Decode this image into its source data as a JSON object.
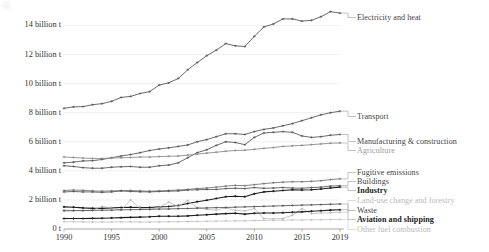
{
  "chart_data": {
    "type": "line",
    "title": "",
    "xlabel": "",
    "ylabel": "",
    "xlim": [
      1990,
      2019
    ],
    "ylim": [
      0,
      15.2
    ],
    "grid": true,
    "legend_position": "right-inline-labels",
    "y_tick_labels": [
      "0 t",
      "2 billion t",
      "4 billion t",
      "6 billion t",
      "8 billion t",
      "10 billion t",
      "12 billion t",
      "14 billion t"
    ],
    "y_tick_values": [
      0,
      2,
      4,
      6,
      8,
      10,
      12,
      14
    ],
    "x_tick_labels": [
      "1990",
      "1995",
      "2000",
      "2005",
      "2010",
      "2015",
      "2019"
    ],
    "x_tick_values": [
      1990,
      1995,
      2000,
      2005,
      2010,
      2015,
      2019
    ],
    "x": [
      1990,
      1991,
      1992,
      1993,
      1994,
      1995,
      1996,
      1997,
      1998,
      1999,
      2000,
      2001,
      2002,
      2003,
      2004,
      2005,
      2006,
      2007,
      2008,
      2009,
      2010,
      2011,
      2012,
      2013,
      2014,
      2015,
      2016,
      2017,
      2018,
      2019
    ],
    "series": [
      {
        "name": "Electricity and heat",
        "label": "Electricity and heat",
        "color": "#5a5a5a",
        "emphasis": "normal",
        "values": [
          8.3,
          8.4,
          8.42,
          8.55,
          8.62,
          8.78,
          9.05,
          9.12,
          9.32,
          9.45,
          9.9,
          10.05,
          10.35,
          10.95,
          11.45,
          11.92,
          12.3,
          12.75,
          12.6,
          12.55,
          13.25,
          13.9,
          14.1,
          14.45,
          14.45,
          14.3,
          14.35,
          14.6,
          14.95,
          14.85
        ]
      },
      {
        "name": "Transport",
        "label": "Transport",
        "color": "#5a5a5a",
        "emphasis": "normal",
        "values": [
          4.55,
          4.6,
          4.68,
          4.7,
          4.78,
          4.9,
          5.02,
          5.12,
          5.25,
          5.4,
          5.5,
          5.58,
          5.68,
          5.78,
          6.0,
          6.15,
          6.35,
          6.55,
          6.55,
          6.5,
          6.7,
          6.85,
          6.95,
          7.1,
          7.25,
          7.45,
          7.65,
          7.85,
          8.0,
          8.1
        ]
      },
      {
        "name": "Manufacturing & construction",
        "label": "Manufacturing & construction",
        "color": "#5a5a5a",
        "emphasis": "normal",
        "values": [
          4.35,
          4.3,
          4.22,
          4.18,
          4.18,
          4.25,
          4.28,
          4.3,
          4.25,
          4.25,
          4.35,
          4.4,
          4.55,
          4.9,
          5.25,
          5.45,
          5.75,
          6.0,
          5.95,
          5.8,
          6.3,
          6.6,
          6.65,
          6.7,
          6.65,
          6.4,
          6.3,
          6.35,
          6.45,
          6.5
        ]
      },
      {
        "name": "Agriculture",
        "label": "Agriculture",
        "color": "#8d8d8d",
        "emphasis": "muted",
        "values": [
          4.95,
          4.92,
          4.88,
          4.85,
          4.85,
          4.88,
          4.9,
          4.92,
          4.95,
          4.95,
          4.98,
          5.0,
          5.02,
          5.08,
          5.15,
          5.22,
          5.28,
          5.35,
          5.4,
          5.42,
          5.48,
          5.55,
          5.6,
          5.68,
          5.72,
          5.75,
          5.8,
          5.85,
          5.9,
          5.92
        ]
      },
      {
        "name": "Fugitive emissions",
        "label": "Fugitive emissions",
        "color": "#7a7a7a",
        "emphasis": "normal",
        "values": [
          2.65,
          2.68,
          2.66,
          2.62,
          2.6,
          2.62,
          2.64,
          2.65,
          2.62,
          2.6,
          2.62,
          2.65,
          2.68,
          2.72,
          2.78,
          2.82,
          2.88,
          2.95,
          3.0,
          2.98,
          3.05,
          3.12,
          3.18,
          3.22,
          3.25,
          3.25,
          3.28,
          3.32,
          3.4,
          3.45
        ]
      },
      {
        "name": "Buildings",
        "label": "Buildings",
        "color": "#5a5a5a",
        "emphasis": "normal",
        "values": [
          2.55,
          2.58,
          2.55,
          2.55,
          2.52,
          2.55,
          2.62,
          2.58,
          2.56,
          2.55,
          2.58,
          2.6,
          2.62,
          2.68,
          2.7,
          2.72,
          2.72,
          2.78,
          2.8,
          2.78,
          2.85,
          2.8,
          2.82,
          2.85,
          2.82,
          2.8,
          2.85,
          2.88,
          2.95,
          2.98
        ]
      },
      {
        "name": "Industry",
        "label": "Industry",
        "color": "#1e1e1e",
        "emphasis": "bold",
        "values": [
          1.52,
          1.5,
          1.45,
          1.42,
          1.42,
          1.45,
          1.48,
          1.5,
          1.48,
          1.48,
          1.52,
          1.55,
          1.62,
          1.75,
          1.88,
          1.98,
          2.1,
          2.22,
          2.25,
          2.22,
          2.42,
          2.55,
          2.6,
          2.65,
          2.7,
          2.68,
          2.7,
          2.75,
          2.82,
          2.88
        ]
      },
      {
        "name": "Land-use change and forestry",
        "label": "Land-use change and forestry",
        "color": "#b4b4b4",
        "emphasis": "faint",
        "values": [
          1.3,
          1.28,
          1.25,
          1.3,
          1.55,
          1.45,
          1.3,
          2.0,
          1.42,
          1.35,
          1.5,
          1.85,
          1.55,
          1.95,
          1.48,
          1.35,
          1.3,
          1.45,
          1.28,
          1.25,
          1.4,
          0.72,
          0.7,
          0.72,
          0.95,
          1.4,
          1.05,
          1.1,
          1.12,
          1.15
        ]
      },
      {
        "name": "Waste",
        "label": "Waste",
        "color": "#5a5a5a",
        "emphasis": "normal",
        "values": [
          1.25,
          1.26,
          1.27,
          1.28,
          1.29,
          1.3,
          1.32,
          1.33,
          1.34,
          1.35,
          1.37,
          1.38,
          1.4,
          1.41,
          1.43,
          1.45,
          1.47,
          1.48,
          1.5,
          1.52,
          1.54,
          1.56,
          1.58,
          1.6,
          1.62,
          1.64,
          1.66,
          1.68,
          1.7,
          1.72
        ]
      },
      {
        "name": "Aviation and shipping",
        "label": "Aviation and shipping",
        "color": "#1e1e1e",
        "emphasis": "bold",
        "values": [
          0.72,
          0.72,
          0.72,
          0.73,
          0.74,
          0.76,
          0.78,
          0.8,
          0.82,
          0.84,
          0.88,
          0.88,
          0.88,
          0.9,
          0.95,
          0.98,
          1.02,
          1.06,
          1.08,
          1.02,
          1.08,
          1.1,
          1.1,
          1.12,
          1.15,
          1.18,
          1.22,
          1.26,
          1.3,
          1.32
        ]
      },
      {
        "name": "Other fuel combustion",
        "label": "Other fuel combustion",
        "color": "#bdbdbd",
        "emphasis": "faint",
        "values": [
          0.5,
          0.5,
          0.49,
          0.48,
          0.48,
          0.48,
          0.49,
          0.49,
          0.48,
          0.48,
          0.49,
          0.5,
          0.5,
          0.51,
          0.52,
          0.53,
          0.54,
          0.55,
          0.56,
          0.56,
          0.58,
          0.59,
          0.6,
          0.61,
          0.62,
          0.62,
          0.63,
          0.64,
          0.65,
          0.66
        ]
      }
    ],
    "annotations": []
  },
  "labels_layout": [
    {
      "key": "Electricity and heat",
      "text": "Electricity and heat",
      "top": 13,
      "emphasis": "normal"
    },
    {
      "key": "Transport",
      "text": "Transport",
      "top": 112,
      "emphasis": "normal"
    },
    {
      "key": "Manufacturing & construction",
      "text": "Manufacturing & construction",
      "top": 137,
      "emphasis": "normal"
    },
    {
      "key": "Agriculture",
      "text": "Agriculture",
      "top": 146,
      "emphasis": "muted"
    },
    {
      "key": "Fugitive emissions",
      "text": "Fugitive emissions",
      "top": 168,
      "emphasis": "normal"
    },
    {
      "key": "Buildings",
      "text": "Buildings",
      "top": 177,
      "emphasis": "normal"
    },
    {
      "key": "Industry",
      "text": "Industry",
      "top": 186,
      "emphasis": "bold"
    },
    {
      "key": "Land-use change and forestry",
      "text": "Land-use change and forestry",
      "top": 196,
      "emphasis": "faint"
    },
    {
      "key": "Waste",
      "text": "Waste",
      "top": 206,
      "emphasis": "normal"
    },
    {
      "key": "Aviation and shipping",
      "text": "Aviation and shipping",
      "top": 215,
      "emphasis": "bold"
    },
    {
      "key": "Other fuel combustion",
      "text": "Other fuel combustion",
      "top": 225,
      "emphasis": "faint"
    }
  ],
  "style": {
    "line_color": "#5a5a5a",
    "grid_color": "#e9e9e9",
    "axis_color": "#9a9a9a",
    "text_color": "#333333"
  }
}
